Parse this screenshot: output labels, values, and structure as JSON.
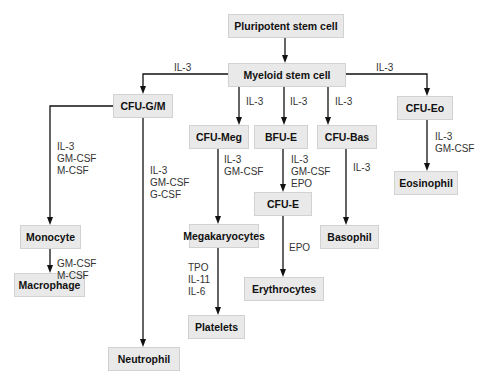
{
  "colors": {
    "box_fill": "#e9e9e9",
    "box_border": "#d2d2d2",
    "line": "#111111",
    "text": "#111111",
    "label_text": "#333333"
  },
  "nodes": {
    "pluripotent": "Pluripotent stem cell",
    "myeloid": "Myeloid stem cell",
    "cfu_gm": "CFU-G/M",
    "cfu_meg": "CFU-Meg",
    "bfu_e": "BFU-E",
    "cfu_bas": "CFU-Bas",
    "cfu_eo": "CFU-Eo",
    "cfu_e": "CFU-E",
    "monocyte": "Monocyte",
    "megakaryocytes": "Megakaryocytes",
    "basophil": "Basophil",
    "eosinophil": "Eosinophil",
    "erythrocytes": "Erythrocytes",
    "macrophage": "Macrophage",
    "platelets": "Platelets",
    "neutrophil": "Neutrophil"
  },
  "edge_labels": {
    "myeloid_to_cfu_gm": "IL-3",
    "myeloid_to_cfu_eo": "IL-3",
    "myeloid_to_cfu_meg": "IL-3",
    "myeloid_to_bfu_e": "IL-3",
    "myeloid_to_cfu_bas": "IL-3",
    "cfu_gm_to_monocyte": "IL-3\nGM-CSF\nM-CSF",
    "cfu_gm_to_neutrophil": "IL-3\nGM-CSF\nG-CSF",
    "cfu_meg_to_megakaryocytes": "IL-3\nGM-CSF",
    "bfu_e_to_cfu_e": "IL-3\nGM-CSF\nEPO",
    "cfu_bas_to_basophil": "IL-3",
    "cfu_eo_to_eosinophil": "IL-3\nGM-CSF",
    "monocyte_to_macrophage": "GM-CSF\nM-CSF",
    "megakaryocytes_to_platelets": "TPO\nIL-11\nIL-6",
    "cfu_e_to_erythrocytes": "EPO"
  },
  "edges": [
    [
      "Pluripotent stem cell",
      "Myeloid stem cell"
    ],
    [
      "Myeloid stem cell",
      "CFU-G/M"
    ],
    [
      "Myeloid stem cell",
      "CFU-Meg"
    ],
    [
      "Myeloid stem cell",
      "BFU-E"
    ],
    [
      "Myeloid stem cell",
      "CFU-Bas"
    ],
    [
      "Myeloid stem cell",
      "CFU-Eo"
    ],
    [
      "CFU-G/M",
      "Monocyte"
    ],
    [
      "CFU-G/M",
      "Neutrophil"
    ],
    [
      "Monocyte",
      "Macrophage"
    ],
    [
      "CFU-Meg",
      "Megakaryocytes"
    ],
    [
      "Megakaryocytes",
      "Platelets"
    ],
    [
      "BFU-E",
      "CFU-E"
    ],
    [
      "CFU-E",
      "Erythrocytes"
    ],
    [
      "CFU-Bas",
      "Basophil"
    ],
    [
      "CFU-Eo",
      "Eosinophil"
    ]
  ]
}
